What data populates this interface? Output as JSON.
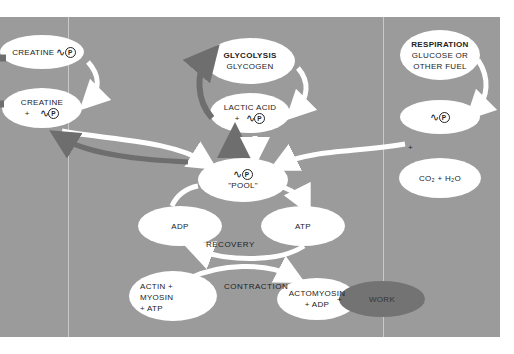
{
  "diagram": {
    "colors": {
      "background": "#ffffff",
      "panel": "#9b9b9b",
      "node_fill": "#ffffff",
      "dark_arrow": "#6e6e6e",
      "light_arrow": "#ffffff",
      "work_node": "#737373",
      "text": "#222222"
    },
    "phosphate_symbol": "~P",
    "nodes": {
      "creatine_p": {
        "line1": "CREATINE"
      },
      "creatine_plus_p": {
        "line1": "CREATINE",
        "line2": "+"
      },
      "glycolysis": {
        "line1": "GLYCOLYSIS",
        "line2": "GLYCOGEN"
      },
      "lactic_acid": {
        "line1": "LACTIC  ACID",
        "line2": "+"
      },
      "respiration": {
        "line1": "RESPIRATION",
        "line2": "GLUCOSE OR",
        "line3": "OTHER FUEL"
      },
      "respiration_p": {
        "line1": ""
      },
      "co2_h2o": {
        "line1": "CO₂ +  H₂O"
      },
      "pool": {
        "line1": "\"POOL\""
      },
      "adp": {
        "line1": "ADP"
      },
      "atp": {
        "line1": "ATP"
      },
      "actin_myosin": {
        "line1": "ACTIN  +",
        "line2": "MYOSIN",
        "line3": "+ ATP"
      },
      "actomyosin": {
        "line1": "ACTOMYOSIN",
        "line2": "+  ADP"
      },
      "work": {
        "line1": "WORK"
      }
    },
    "labels": {
      "recovery": "RECOVERY",
      "contraction": "CONTRACTION",
      "plus_resp": "+",
      "plus_work": "+"
    }
  }
}
